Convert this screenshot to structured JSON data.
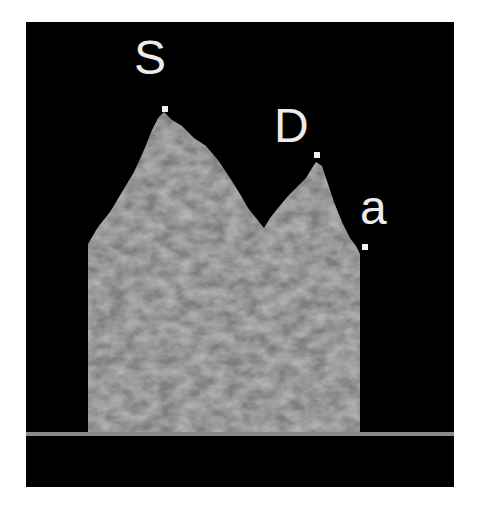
{
  "figure": {
    "background_color": "#000000",
    "spectrum_color": "#7a7a7a",
    "baseline_color": "#8a8a8a",
    "labels": [
      {
        "id": "S",
        "text": "S"
      },
      {
        "id": "D",
        "text": "D"
      },
      {
        "id": "a",
        "text": "a"
      }
    ]
  }
}
